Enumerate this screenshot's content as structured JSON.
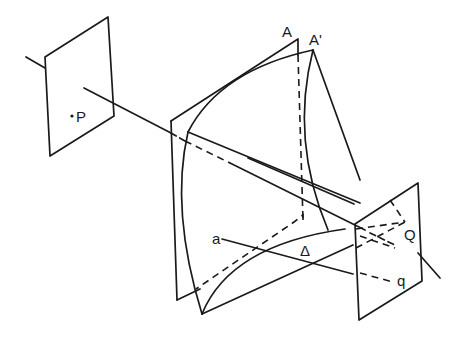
{
  "diagram": {
    "type": "geometric-optics-projection",
    "labels": {
      "P": "P",
      "A": "A",
      "A_prime": "A'",
      "Q": "Q",
      "q": "q",
      "a": "a",
      "Delta": "Δ"
    },
    "colors": {
      "background": "#ffffff",
      "stroke": "#1a1a1a"
    }
  }
}
